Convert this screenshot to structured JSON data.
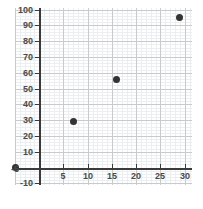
{
  "chart_data": {
    "type": "scatter",
    "title": "",
    "xlabel": "",
    "ylabel": "",
    "xlim": [
      -5,
      31.5
    ],
    "ylim": [
      -11,
      101
    ],
    "grid": true,
    "legend": "none",
    "x_ticks": [
      5,
      10,
      15,
      20,
      25,
      30
    ],
    "x_tick_labels": [
      "5",
      "10",
      "15",
      "20",
      "25",
      "30"
    ],
    "x_extra_ticks": [
      -5
    ],
    "x_extra_tick_labels": [
      "-5"
    ],
    "y_ticks": [
      -10,
      10,
      20,
      30,
      40,
      50,
      60,
      70,
      80,
      90,
      100
    ],
    "y_tick_labels": [
      "-10",
      "10",
      "20",
      "30",
      "40",
      "50",
      "60",
      "70",
      "80",
      "90",
      "100"
    ],
    "major_grid_step_x": 5,
    "major_grid_step_y": 10,
    "minor_grid_step_x": 1,
    "minor_grid_step_y": 2,
    "point_color": "#333333",
    "major_grid_color": "#c7cbce",
    "minor_grid_color": "#eceff1",
    "axis_color": "#3a3a3a",
    "points": [
      {
        "x": -5,
        "y": 0,
        "label": "(-5, 0)"
      },
      {
        "x": 7,
        "y": 29,
        "label": "(7, 29)"
      },
      {
        "x": 16,
        "y": 56,
        "label": "(16, 56)"
      },
      {
        "x": 29,
        "y": 95,
        "label": "(29, 95)"
      }
    ],
    "series": [
      {
        "name": "data",
        "x": [
          -5,
          7,
          16,
          29
        ],
        "values": [
          0,
          29,
          56,
          95
        ]
      }
    ]
  }
}
